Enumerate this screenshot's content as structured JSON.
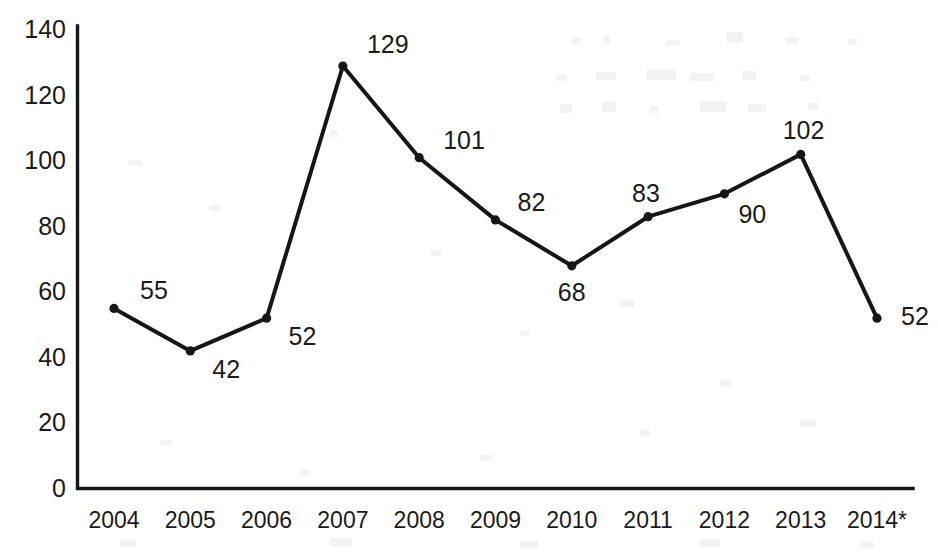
{
  "chart_data": {
    "type": "line",
    "title": "",
    "subtitle": "",
    "xlabel": "",
    "ylabel": "",
    "categories": [
      "2004",
      "2005",
      "2006",
      "2007",
      "2008",
      "2009",
      "2010",
      "2011",
      "2012",
      "2013",
      "2014*"
    ],
    "values": [
      55,
      42,
      52,
      129,
      101,
      82,
      68,
      83,
      90,
      102,
      52
    ],
    "data_labels": [
      "55",
      "42",
      "52",
      "129",
      "101",
      "82",
      "68",
      "83",
      "90",
      "102",
      "52"
    ],
    "series": [
      {
        "name": "",
        "values": [
          55,
          42,
          52,
          129,
          101,
          82,
          68,
          83,
          90,
          102,
          52
        ]
      }
    ],
    "ylim": [
      0,
      140
    ],
    "yticks": [
      0,
      20,
      40,
      60,
      80,
      100,
      120,
      140
    ],
    "ytick_labels": [
      "0",
      "20",
      "40",
      "60",
      "80",
      "100",
      "120",
      "140"
    ],
    "grid": false,
    "legend": "none",
    "legend_position": "none",
    "marker": "circle",
    "line_color": "#161616",
    "text_color": "#1a1a1a",
    "axis_color": "#161616",
    "background_color": "#ffffff",
    "annotations": [
      "2014* denotes provisional or projected value"
    ],
    "label_offsets": [
      {
        "dx": 26,
        "dy": -30
      },
      {
        "dx": 22,
        "dy": 6
      },
      {
        "dx": 22,
        "dy": 6
      },
      {
        "dx": 24,
        "dy": -34
      },
      {
        "dx": 24,
        "dy": -30
      },
      {
        "dx": 22,
        "dy": -30
      },
      {
        "dx": -14,
        "dy": 14
      },
      {
        "dx": -16,
        "dy": -36
      },
      {
        "dx": 14,
        "dy": 8
      },
      {
        "dx": -18,
        "dy": -36
      },
      {
        "dx": 24,
        "dy": -14
      }
    ]
  }
}
